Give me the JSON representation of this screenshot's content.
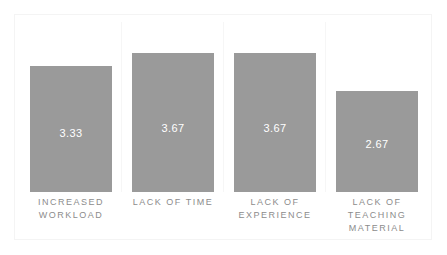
{
  "chart_data": {
    "type": "bar",
    "title": "",
    "subtitle": "",
    "xlabel": "",
    "ylabel": "",
    "categories": [
      "INCREASED WORKLOAD",
      "LACK OF TIME",
      "LACK OF EXPERIENCE",
      "LACK OF TEACHING MATERIAL"
    ],
    "category_lines": [
      [
        "INCREASED",
        "WORKLOAD"
      ],
      [
        "LACK OF TIME"
      ],
      [
        "LACK OF",
        "EXPERIENCE"
      ],
      [
        "LACK OF",
        "TEACHING",
        "MATERIAL"
      ]
    ],
    "values": [
      3.33,
      3.67,
      3.67,
      2.67
    ],
    "value_labels": [
      "3.33",
      "3.67",
      "3.67",
      "2.67"
    ],
    "ylim": [
      0,
      4.5
    ],
    "grid": "vertical-category-separators",
    "legend": "none",
    "bar_color": "#9a9a9a",
    "value_label_color": "#ffffff",
    "category_label_color": "#8c8c8c",
    "background_color": "#ffffff",
    "frame_color": "#f4f4f4",
    "gridline_color": "#f6f6f6"
  }
}
